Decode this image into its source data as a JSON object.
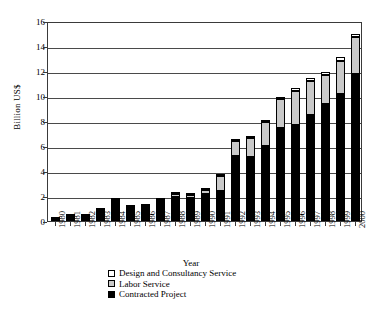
{
  "chart_data": {
    "type": "bar",
    "subtype": "stacked-bar",
    "title": "",
    "xlabel": "Year",
    "ylabel": "Billion US$",
    "ylim": [
      0,
      16
    ],
    "ytick_step": 2,
    "ytick_labels": [
      "0",
      "2",
      "4",
      "6",
      "8",
      "10",
      "12",
      "14",
      "16"
    ],
    "grid": true,
    "grid_axis": "y",
    "legend_position": "bottom",
    "categories": [
      "1980",
      "1981",
      "1982",
      "1983",
      "1984",
      "1985",
      "1986",
      "1987",
      "1988",
      "1989",
      "1990",
      "1991",
      "1992",
      "1993",
      "1994",
      "1995",
      "1996",
      "1997",
      "1998",
      "1999",
      "2000"
    ],
    "series": [
      {
        "name": "Contracted Project",
        "color": "#000000",
        "values": [
          0.15,
          0.4,
          0.4,
          0.85,
          1.55,
          1.15,
          1.2,
          1.65,
          1.9,
          1.85,
          2.15,
          2.4,
          5.2,
          5.1,
          6.0,
          7.45,
          7.7,
          8.45,
          9.35,
          10.2,
          11.8
        ]
      },
      {
        "name": "Labor Service",
        "color": "#c9c9c9",
        "values": [
          0.05,
          0.1,
          0.1,
          0.1,
          0.1,
          0.1,
          0.15,
          0.15,
          0.25,
          0.25,
          0.35,
          1.2,
          1.2,
          1.55,
          1.9,
          2.3,
          2.7,
          2.75,
          2.35,
          2.6,
          2.9
        ]
      },
      {
        "name": "Design and Consultancy Service",
        "color": "#ffffff",
        "values": [
          0.0,
          0.0,
          0.0,
          0.0,
          0.05,
          0.0,
          0.0,
          0.0,
          0.05,
          0.05,
          0.05,
          0.05,
          0.1,
          0.1,
          0.1,
          0.15,
          0.25,
          0.25,
          0.25,
          0.3,
          0.3
        ]
      }
    ],
    "totals": [
      0.2,
      0.5,
      0.5,
      0.95,
      1.7,
      1.25,
      1.35,
      1.8,
      2.2,
      2.15,
      2.55,
      3.65,
      6.5,
      6.75,
      8.0,
      9.9,
      10.65,
      11.45,
      11.95,
      13.1,
      15.0
    ]
  },
  "legend": {
    "items": [
      {
        "label": "Design and Consultancy Service",
        "swatch": "design"
      },
      {
        "label": "Labor Service",
        "swatch": "labor"
      },
      {
        "label": "Contracted Project",
        "swatch": "contracted"
      }
    ]
  }
}
